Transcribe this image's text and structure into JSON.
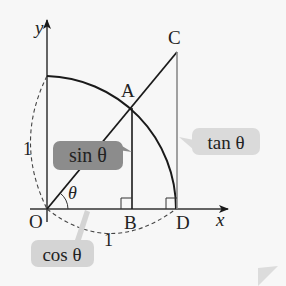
{
  "diagram": {
    "axes": {
      "x_label": "x",
      "y_label": "y"
    },
    "points": {
      "O": "O",
      "A": "A",
      "B": "B",
      "C": "C",
      "D": "D"
    },
    "radius_labels": {
      "vertical": "1",
      "horizontal": "1"
    },
    "angle_label": "θ",
    "callouts": {
      "sin": "sin θ",
      "cos": "cos θ",
      "tan": "tan θ"
    },
    "colors": {
      "background": "#f7f7f7",
      "line": "#1a1a1a",
      "gray_line": "#8a8a8a",
      "sin_callout_fill": "#8c8c8c",
      "cos_callout_fill": "#d4d4d4",
      "tan_callout_fill": "#dadada",
      "page_curl": "#dcdcdc"
    }
  }
}
